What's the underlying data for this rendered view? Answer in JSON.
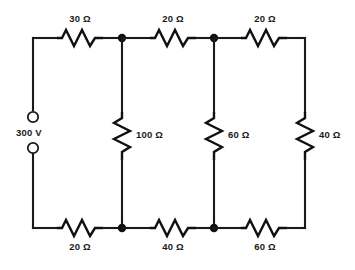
{
  "diagram": {
    "source": {
      "label": "300 V",
      "terminal_top": "terminal-open-circle",
      "terminal_bottom": "terminal-open-circle"
    },
    "top_branch": [
      {
        "id": "r-top-1",
        "label": "30 Ω",
        "value": 30,
        "unit": "Ω"
      },
      {
        "id": "r-top-2",
        "label": "20 Ω",
        "value": 20,
        "unit": "Ω"
      },
      {
        "id": "r-top-3",
        "label": "20 Ω",
        "value": 20,
        "unit": "Ω"
      }
    ],
    "shunt_branch": [
      {
        "id": "r-shunt-1",
        "label": "100 Ω",
        "value": 100,
        "unit": "Ω"
      },
      {
        "id": "r-shunt-2",
        "label": "60 Ω",
        "value": 60,
        "unit": "Ω"
      },
      {
        "id": "r-shunt-3",
        "label": "40 Ω",
        "value": 40,
        "unit": "Ω"
      }
    ],
    "bottom_branch": [
      {
        "id": "r-bot-1",
        "label": "20 Ω",
        "value": 20,
        "unit": "Ω"
      },
      {
        "id": "r-bot-2",
        "label": "40 Ω",
        "value": 40,
        "unit": "Ω"
      },
      {
        "id": "r-bot-3",
        "label": "60 Ω",
        "value": 60,
        "unit": "Ω"
      }
    ],
    "colors": {
      "wire": "#1a1a1a",
      "text": "#1a1a1a",
      "background": "#ffffff"
    }
  }
}
